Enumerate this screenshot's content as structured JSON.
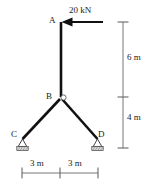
{
  "figure": {
    "type": "structural-truss-diagram",
    "background_color": "#ffffff",
    "line_color": "#111111",
    "dimension_color": "#555555"
  },
  "joints": [
    {
      "id": "A",
      "label": "A",
      "x": 61,
      "y": 22,
      "role": "free-top-end"
    },
    {
      "id": "B",
      "label": "B",
      "x": 61,
      "y": 97,
      "role": "pin-joint"
    },
    {
      "id": "C",
      "label": "C",
      "x": 22,
      "y": 139,
      "role": "support"
    },
    {
      "id": "D",
      "label": "D",
      "x": 98,
      "y": 139,
      "role": "support"
    }
  ],
  "members": [
    {
      "name": "member-AB",
      "from": "A",
      "to": "B"
    },
    {
      "name": "member-BC",
      "from": "B",
      "to": "C"
    },
    {
      "name": "member-BD",
      "from": "B",
      "to": "D"
    }
  ],
  "load": {
    "label": "20 kN",
    "magnitude": 20,
    "unit": "kN",
    "applied_at": "A",
    "direction": "leftward-horizontal",
    "arrow_tail_x": 103,
    "arrow_head_x": 62,
    "arrow_y": 22
  },
  "supports": [
    {
      "at": "C",
      "type": "pinned-hatched"
    },
    {
      "at": "D",
      "type": "pinned-hatched"
    }
  ],
  "dimensions": {
    "vertical": {
      "line_x": 123,
      "segments": [
        {
          "label": "6 m",
          "value": 6,
          "unit": "m",
          "from_y": 22,
          "to_y": 97
        },
        {
          "label": "4 m",
          "value": 4,
          "unit": "m",
          "from_y": 97,
          "to_y": 148
        }
      ]
    },
    "horizontal": {
      "line_y": 173,
      "segments": [
        {
          "label": "3 m",
          "value": 3,
          "unit": "m",
          "from_x": 22,
          "to_x": 60
        },
        {
          "label": "3 m",
          "value": 3,
          "unit": "m",
          "from_x": 60,
          "to_x": 98
        }
      ]
    }
  }
}
